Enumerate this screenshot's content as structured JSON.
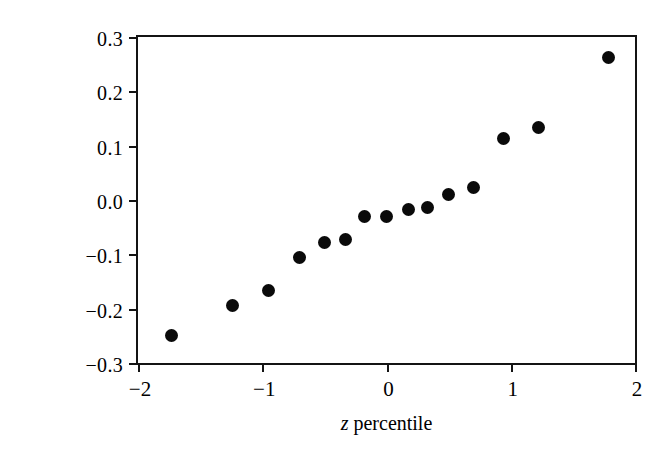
{
  "chart_data": {
    "type": "scatter",
    "title": "",
    "subtitle": "",
    "xlabel_parts": {
      "symbol": "z",
      "rest": " percentile"
    },
    "xlabel": "z percentile",
    "ylabel": "Effect estimate",
    "xlim": [
      -2,
      2
    ],
    "ylim": [
      -0.3,
      0.3
    ],
    "xticks": [
      -2,
      -1,
      0,
      1,
      2
    ],
    "xtick_labels": [
      "−2",
      "−1",
      "0",
      "1",
      "2"
    ],
    "yticks": [
      0.3,
      0.2,
      0.1,
      0.0,
      -0.1,
      -0.2,
      -0.3
    ],
    "ytick_labels": [
      "0.3",
      "0.2",
      "0.1",
      "0.0",
      "−0.1",
      "−0.2",
      "−0.3"
    ],
    "grid": false,
    "legend": false,
    "marker": "filled-circle",
    "marker_color": "#0a0a0a",
    "frame_color": "#141414",
    "background": "#ffffff",
    "n_points": 15,
    "x": [
      -1.73,
      -1.24,
      -0.95,
      -0.7,
      -0.5,
      -0.33,
      -0.18,
      0.0,
      0.18,
      0.33,
      0.5,
      0.7,
      0.94,
      1.22,
      1.79
    ],
    "y": [
      -0.25,
      -0.195,
      -0.167,
      -0.105,
      -0.079,
      -0.072,
      -0.03,
      -0.03,
      -0.018,
      -0.013,
      0.01,
      0.023,
      0.114,
      0.134,
      0.262
    ],
    "points": [
      {
        "x": -1.73,
        "y": -0.25
      },
      {
        "x": -1.24,
        "y": -0.195
      },
      {
        "x": -0.95,
        "y": -0.167
      },
      {
        "x": -0.7,
        "y": -0.105
      },
      {
        "x": -0.5,
        "y": -0.079
      },
      {
        "x": -0.33,
        "y": -0.072
      },
      {
        "x": -0.18,
        "y": -0.03
      },
      {
        "x": 0.0,
        "y": -0.03
      },
      {
        "x": 0.18,
        "y": -0.018
      },
      {
        "x": 0.33,
        "y": -0.013
      },
      {
        "x": 0.5,
        "y": 0.01
      },
      {
        "x": 0.7,
        "y": 0.023
      },
      {
        "x": 0.94,
        "y": 0.114
      },
      {
        "x": 1.22,
        "y": 0.134
      },
      {
        "x": 1.79,
        "y": 0.262
      }
    ]
  }
}
